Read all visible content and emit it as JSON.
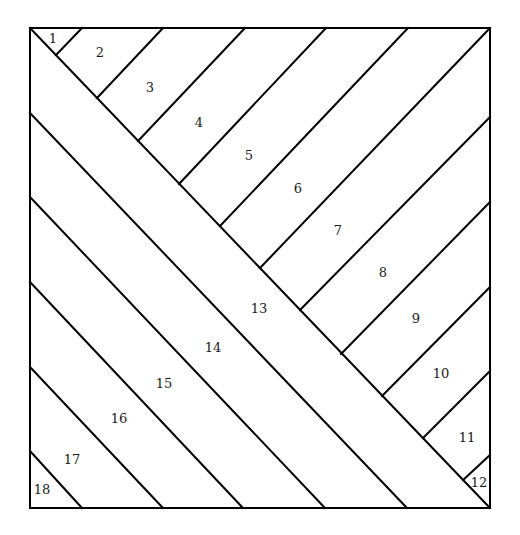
{
  "diagram": {
    "frame": {
      "x": 30,
      "y": 28,
      "width": 460,
      "height": 480
    },
    "colors": {
      "line": "#000000",
      "background": "#ffffff",
      "label": "#1a1a1a"
    },
    "lines": [
      {
        "id": "main-diagonal",
        "x1": 30,
        "y1": 28,
        "x2": 490,
        "y2": 508
      },
      {
        "id": "band-13-lower",
        "x1": 30,
        "y1": 113,
        "x2": 407,
        "y2": 508
      },
      {
        "id": "band-14-lower",
        "x1": 30,
        "y1": 197,
        "x2": 325,
        "y2": 508
      },
      {
        "id": "band-15-lower",
        "x1": 30,
        "y1": 282,
        "x2": 243,
        "y2": 508
      },
      {
        "id": "band-16-lower",
        "x1": 30,
        "y1": 367,
        "x2": 163,
        "y2": 508
      },
      {
        "id": "band-17-lower",
        "x1": 30,
        "y1": 451,
        "x2": 82,
        "y2": 508
      },
      {
        "id": "strip-1-2",
        "x1": 82,
        "y1": 28,
        "x2": 56,
        "y2": 55
      },
      {
        "id": "strip-2-3",
        "x1": 163,
        "y1": 28,
        "x2": 97,
        "y2": 98
      },
      {
        "id": "strip-3-4",
        "x1": 245,
        "y1": 28,
        "x2": 138,
        "y2": 141
      },
      {
        "id": "strip-4-5",
        "x1": 326,
        "y1": 28,
        "x2": 179,
        "y2": 184
      },
      {
        "id": "strip-5-6",
        "x1": 408,
        "y1": 28,
        "x2": 220,
        "y2": 226
      },
      {
        "id": "strip-6-7",
        "x1": 490,
        "y1": 28,
        "x2": 260,
        "y2": 268
      },
      {
        "id": "strip-7-8",
        "x1": 490,
        "y1": 117,
        "x2": 300,
        "y2": 310
      },
      {
        "id": "strip-8-9",
        "x1": 490,
        "y1": 202,
        "x2": 341,
        "y2": 354
      },
      {
        "id": "strip-9-10",
        "x1": 490,
        "y1": 287,
        "x2": 382,
        "y2": 396
      },
      {
        "id": "strip-10-11",
        "x1": 490,
        "y1": 371,
        "x2": 423,
        "y2": 438
      },
      {
        "id": "strip-11-12",
        "x1": 490,
        "y1": 455,
        "x2": 463,
        "y2": 480
      }
    ],
    "pieces": [
      {
        "label": "1",
        "x": 53,
        "y": 38
      },
      {
        "label": "2",
        "x": 100,
        "y": 52
      },
      {
        "label": "3",
        "x": 150,
        "y": 87
      },
      {
        "label": "4",
        "x": 199,
        "y": 122
      },
      {
        "label": "5",
        "x": 249,
        "y": 155
      },
      {
        "label": "6",
        "x": 298,
        "y": 188
      },
      {
        "label": "7",
        "x": 338,
        "y": 230
      },
      {
        "label": "8",
        "x": 383,
        "y": 272
      },
      {
        "label": "9",
        "x": 416,
        "y": 318
      },
      {
        "label": "10",
        "x": 441,
        "y": 373
      },
      {
        "label": "11",
        "x": 467,
        "y": 437
      },
      {
        "label": "12",
        "x": 479,
        "y": 482
      },
      {
        "label": "13",
        "x": 259,
        "y": 308
      },
      {
        "label": "14",
        "x": 213,
        "y": 347
      },
      {
        "label": "15",
        "x": 164,
        "y": 383
      },
      {
        "label": "16",
        "x": 119,
        "y": 418
      },
      {
        "label": "17",
        "x": 72,
        "y": 459
      },
      {
        "label": "18",
        "x": 42,
        "y": 489
      }
    ]
  }
}
